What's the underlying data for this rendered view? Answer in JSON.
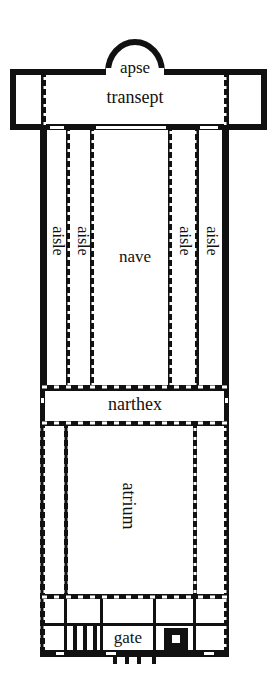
{
  "diagram": {
    "type": "basilica-floor-plan",
    "colors": {
      "wall": "#111111",
      "background": "#ffffff",
      "text": "#111111"
    },
    "labels": {
      "apse": "apse",
      "transept": "transept",
      "aisle_outer_left": "aisle",
      "aisle_inner_left": "aisle",
      "nave": "nave",
      "aisle_inner_right": "aisle",
      "aisle_outer_right": "aisle",
      "narthex": "narthex",
      "atrium": "atrium",
      "gate": "gate"
    }
  }
}
